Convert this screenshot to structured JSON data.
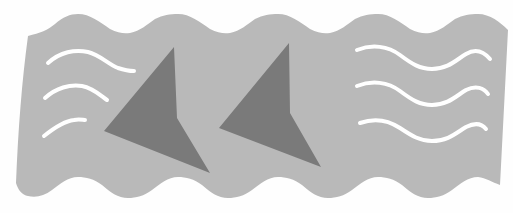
{
  "illustration": {
    "subject": "shark fins in waves",
    "colors": {
      "background": "#fefefe",
      "water": "#b9b9b9",
      "fin": "#7a7a7a",
      "wave_line": "#ffffff"
    },
    "fins": [
      {
        "name": "fin-left",
        "points": "174,47 177,118 210,173 104,131"
      },
      {
        "name": "fin-right",
        "points": "289,43 290,113 321,167 219,128"
      }
    ],
    "left_wave_lines": 3,
    "right_wave_lines": 3
  }
}
